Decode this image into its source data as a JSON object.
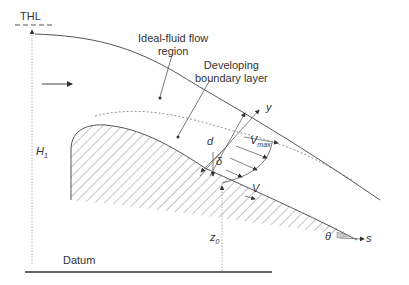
{
  "diagram": {
    "labels": {
      "thl": "THL",
      "ideal_fluid_line1": "Ideal-fluid flow",
      "ideal_fluid_line2": "region",
      "developing_line1": "Developing",
      "developing_line2": "boundary layer",
      "y_axis": "y",
      "s_axis": "s",
      "d": "d",
      "delta": "δ",
      "vmax_main": "V",
      "vmax_sub": "max",
      "v": "V",
      "h1_main": "H",
      "h1_sub": "1",
      "z0_main": "z",
      "z0_sub": "0",
      "theta": "θ",
      "datum": "Datum"
    },
    "colors": {
      "line": "#555555",
      "hatch": "#888888",
      "text": "#333333"
    }
  }
}
